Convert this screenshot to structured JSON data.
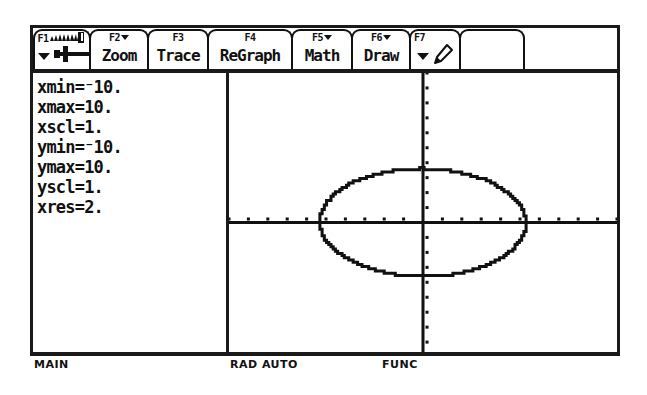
{
  "device": {
    "name": "TI-89 graphing calculator screen"
  },
  "toolbar": {
    "tabs": [
      {
        "fkey": "F1",
        "label": "",
        "icon": "tools-saw-icon",
        "has_caret": true
      },
      {
        "fkey": "F2",
        "label": "Zoom",
        "icon": "",
        "has_caret": true
      },
      {
        "fkey": "F3",
        "label": "Trace",
        "icon": "",
        "has_caret": false
      },
      {
        "fkey": "F4",
        "label": "ReGraph",
        "icon": "",
        "has_caret": false
      },
      {
        "fkey": "F5",
        "label": "Math",
        "icon": "",
        "has_caret": true
      },
      {
        "fkey": "F6",
        "label": "Draw",
        "icon": "",
        "has_caret": true
      },
      {
        "fkey": "F7",
        "label": "",
        "icon": "pencil-icon",
        "has_caret": true
      },
      {
        "fkey": "",
        "label": "",
        "icon": "",
        "has_caret": false
      }
    ]
  },
  "window_vars": {
    "title": "Window Variables",
    "lines": [
      "xmin=⁻10.",
      "xmax=10.",
      "xscl=1.",
      "ymin=⁻10.",
      "ymax=10.",
      "yscl=1.",
      "xres=2."
    ],
    "entries": [
      {
        "name": "xmin",
        "value": "-10."
      },
      {
        "name": "xmax",
        "value": "10."
      },
      {
        "name": "xscl",
        "value": "1."
      },
      {
        "name": "ymin",
        "value": "-10."
      },
      {
        "name": "ymax",
        "value": "10."
      },
      {
        "name": "yscl",
        "value": "1."
      },
      {
        "name": "xres",
        "value": "2."
      }
    ]
  },
  "status_bar": {
    "folder": "MAIN",
    "mode": "RAD AUTO",
    "graph_mode": "FUNC"
  },
  "colors": {
    "ink": "#111111",
    "screen_background": "#ffffff",
    "border": "#1a1a1a"
  },
  "chart_data": {
    "type": "line",
    "title": "",
    "xlabel": "",
    "ylabel": "",
    "xlim": [
      -10,
      10
    ],
    "ylim": [
      -10,
      10
    ],
    "xscl": 1,
    "yscl": 1,
    "grid": false,
    "axes_visible": true,
    "tick_marks": true,
    "legend": "none",
    "curve": {
      "name": "ellipse",
      "description": "Ellipse centered at the origin spanning roughly x in [-5.3,5.3] and y in [-3.6,3.6]",
      "center": [
        0,
        0
      ],
      "semi_axis_x": 5.3,
      "semi_axis_y": 3.6,
      "closed": true
    }
  }
}
